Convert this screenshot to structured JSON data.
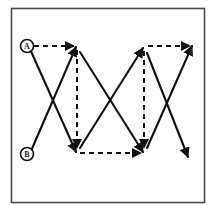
{
  "figure": {
    "border": {
      "x": 11,
      "y": 8,
      "width": 194,
      "height": 195,
      "color": "#4a4a4a"
    },
    "background": "#ffffff",
    "stroke_color": "#111111",
    "solid_stroke_width": 2.1,
    "dashed_stroke_width": 2.0,
    "dash_pattern": "5,4"
  },
  "labels": [
    {
      "id": "A",
      "text": "A",
      "cx": 27,
      "cy": 46,
      "r": 7
    },
    {
      "id": "B",
      "text": "B",
      "cx": 27,
      "cy": 154,
      "r": 7
    }
  ],
  "vertices": {
    "a_start": {
      "x": 27,
      "y": 46
    },
    "b_start": {
      "x": 27,
      "y": 154
    },
    "top_1": {
      "x": 76,
      "y": 47
    },
    "top_2": {
      "x": 143,
      "y": 48
    },
    "top_3": {
      "x": 192,
      "y": 46
    },
    "bottom_1": {
      "x": 76,
      "y": 152
    },
    "bottom_2": {
      "x": 143,
      "y": 152
    },
    "bottom_end": {
      "x": 188,
      "y": 157
    }
  },
  "solid_paths": [
    {
      "name": "a-to-bottom1",
      "x1": 30,
      "y1": 49,
      "x2": 76,
      "y2": 152,
      "arrow": true
    },
    {
      "name": "b-to-top1",
      "x1": 31,
      "y1": 151,
      "x2": 76,
      "y2": 47,
      "arrow": true
    },
    {
      "name": "top1-to-bottom2",
      "x1": 80,
      "y1": 52,
      "x2": 143,
      "y2": 152,
      "arrow": true
    },
    {
      "name": "bottom1-to-top2",
      "x1": 80,
      "y1": 148,
      "x2": 143,
      "y2": 48,
      "arrow": true
    },
    {
      "name": "top2-to-bottomend",
      "x1": 147,
      "y1": 53,
      "x2": 188,
      "y2": 157,
      "arrow": true
    },
    {
      "name": "bottom2-to-top3",
      "x1": 147,
      "y1": 148,
      "x2": 192,
      "y2": 46,
      "arrow": true
    }
  ],
  "dashed_paths": [
    {
      "name": "a-to-top1-horizontal",
      "x1": 34,
      "y1": 46,
      "x2": 76,
      "y2": 46,
      "arrow": true
    },
    {
      "name": "top1-vertical-down",
      "x1": 77,
      "y1": 50,
      "x2": 77,
      "y2": 150,
      "arrow": true
    },
    {
      "name": "bottom1-to-bottom2-horizontal",
      "x1": 79,
      "y1": 153,
      "x2": 143,
      "y2": 153,
      "arrow": true
    },
    {
      "name": "top2-vertical-down",
      "x1": 144,
      "y1": 51,
      "x2": 144,
      "y2": 150,
      "arrow": true
    },
    {
      "name": "top2-to-top3-horizontal",
      "x1": 147,
      "y1": 46,
      "x2": 192,
      "y2": 46,
      "arrow": true
    }
  ]
}
